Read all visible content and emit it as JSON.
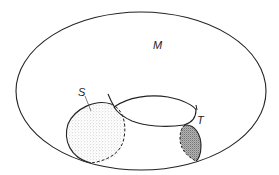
{
  "figure": {
    "type": "topology-diagram",
    "labels": {
      "manifold": "M",
      "disc_left": "S",
      "disc_right": "T"
    },
    "colors": {
      "stroke": "#222222",
      "background": "#ffffff",
      "light_stipple": "#b8b8b8",
      "dark_stipple": "#8a8a8a"
    }
  }
}
